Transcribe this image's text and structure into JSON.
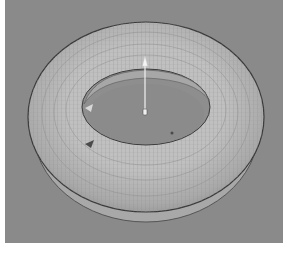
{
  "viewport": {
    "label": "3D viewport",
    "background": "#8a8a8a",
    "object": {
      "type": "torus",
      "display": "wireframe-shaded",
      "surface_color": "#b3b3b3",
      "wire_color": "#7a7a7a",
      "outline_color": "#3a3a3a"
    },
    "gizmo": {
      "type": "translate-y-axis",
      "shaft_color": "#f2f2f2",
      "handle_color": "#f5f5f5"
    }
  }
}
